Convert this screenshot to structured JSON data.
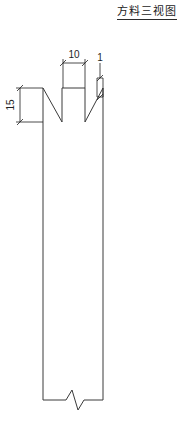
{
  "document": {
    "title": "方料三视图",
    "title_underline": true
  },
  "drawing": {
    "type": "engineering-elevation-view",
    "line_color": "#3a3a3a",
    "dimension_color": "#1f1f1f",
    "background": "#ffffff",
    "dimensions": [
      {
        "id": "width-notch",
        "label": "10",
        "orientation": "horizontal",
        "unit": "mm",
        "position": "above-top-tab"
      },
      {
        "id": "notch-depth",
        "label": "15",
        "orientation": "vertical",
        "unit": "mm",
        "position": "left-of-part"
      },
      {
        "id": "edge-thickness",
        "label": "1",
        "orientation": "vertical",
        "unit": "mm",
        "position": "right-of-part"
      }
    ],
    "features": {
      "body_label": "square-stock-body",
      "notch_label": "v-notch",
      "tab_label": "raised-tab",
      "break_label": "break-line"
    }
  },
  "geometry": {
    "body_left": 43,
    "body_right": 103,
    "body_top": 88,
    "body_bottom": 400,
    "notch_bottom": 122,
    "tab_left": 62,
    "tab_right": 85,
    "dim10_y": 63,
    "dim15_x": 20
  }
}
